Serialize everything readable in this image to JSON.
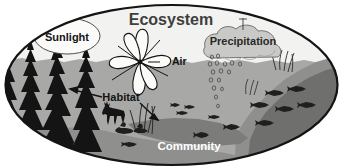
{
  "figure": {
    "title": "Ecosystem",
    "type": "labeled-illustration",
    "shape": "ellipse",
    "background_color": "#ffffff"
  },
  "labels": {
    "ecosystem": "Ecosystem",
    "sunlight": "Sunlight",
    "precipitation": "Precipitation",
    "air": "Air",
    "habitat": "Habitat",
    "community": "Community"
  },
  "colors": {
    "sky": "#f2f2f0",
    "land_upper": "#a8a8a6",
    "land_lower": "#8f8f8d",
    "water_dark": "#6f6f6d",
    "forest": "#1a1a1a",
    "cloud": "#c9c9c7",
    "outline": "#1a1a1a",
    "label_dark": "#1a1a1a",
    "label_light": "#ffffff"
  },
  "elements": {
    "conifer_trees": "forest-silhouette",
    "pinwheel": "pinwheel-windmill",
    "cloud": "rain-cloud",
    "raindrops": "falling-raindrops",
    "deer": "deer-silhouette",
    "ducks": "waterfowl-silhouette",
    "fish": "fish-silhouette",
    "reeds": "reed-grass",
    "sun_ellipse": "sunlight-ellipse",
    "horizon": "wavy-horizon-line"
  },
  "arrows": {
    "habitat_left": "arrow-to-forest",
    "habitat_right": "arrow-to-pond",
    "air_pointer": "pointer-to-pinwheel",
    "precipitation_pointer": "pointer-to-cloud"
  }
}
